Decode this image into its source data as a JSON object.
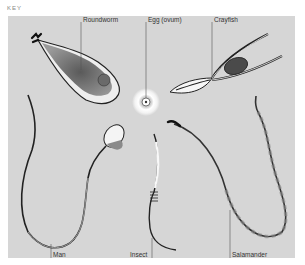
{
  "header": {
    "key_label": "KEY"
  },
  "diagram": {
    "labels": {
      "roundworm": "Roundworm",
      "egg": "Egg (ovum)",
      "crayfish": "Crayfish",
      "man": "Man",
      "insect": "Insect",
      "salamander": "Salamander"
    },
    "colors": {
      "background": "#d6d6d6",
      "outline": "#222222",
      "fill_dark": "#6e6e6e",
      "fill_light": "#f4f4f4",
      "leader_line": "#555555"
    }
  }
}
